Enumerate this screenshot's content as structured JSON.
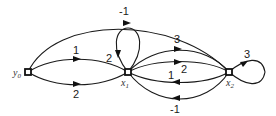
{
  "diagram": {
    "type": "signal-flow-graph",
    "nodes": [
      {
        "id": "y0",
        "base": "y",
        "sub": "0",
        "x": 28,
        "y": 72
      },
      {
        "id": "x1",
        "base": "x",
        "sub": "1",
        "x": 128,
        "y": 72
      },
      {
        "id": "x2",
        "base": "x",
        "sub": "2",
        "x": 229,
        "y": 72
      }
    ],
    "edges": [
      {
        "from": "y0",
        "to": "x2",
        "gain": "-1",
        "label": "-1"
      },
      {
        "from": "y0",
        "to": "x1",
        "gain": "1",
        "label": "1"
      },
      {
        "from": "y0",
        "to": "x1",
        "gain": "2",
        "label": "2"
      },
      {
        "from": "x1",
        "to": "x1",
        "gain": "2",
        "label": "2"
      },
      {
        "from": "x1",
        "to": "x2",
        "gain": "3",
        "label": "3"
      },
      {
        "from": "x1",
        "to": "x2",
        "gain": "2",
        "label": "2"
      },
      {
        "from": "x2",
        "to": "x1",
        "gain": "1",
        "label": "1"
      },
      {
        "from": "x2",
        "to": "x1",
        "gain": "-1",
        "label": "-1"
      },
      {
        "from": "x2",
        "to": "x2",
        "gain": "3",
        "label": "3"
      }
    ]
  }
}
